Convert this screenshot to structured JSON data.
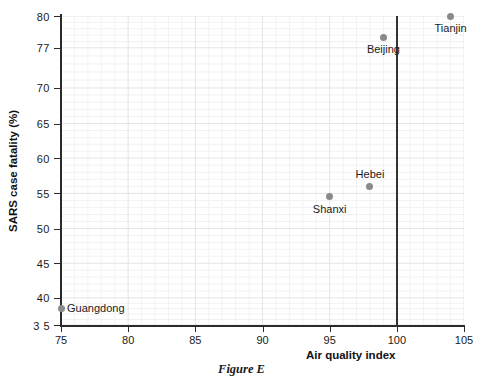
{
  "caption": "Figure E",
  "chart_data": {
    "type": "scatter",
    "title": "",
    "xlabel": "Air quality index",
    "ylabel": "SARS case fatality (%)",
    "xlim": [
      75,
      105
    ],
    "ylim": [
      35,
      80
    ],
    "grid": true,
    "legend": "none",
    "x_ticks": [
      75,
      80,
      85,
      90,
      95,
      100,
      105
    ],
    "x_tick_labels": [
      "75",
      "80",
      "85",
      "90",
      "95",
      "100",
      "105"
    ],
    "y_ticks": [
      35,
      40,
      45,
      50,
      55,
      60,
      65,
      70,
      77,
      80
    ],
    "y_tick_labels": [
      "3 5",
      "40",
      "45",
      "50",
      "55",
      "60",
      "65",
      "70",
      "77",
      "80"
    ],
    "annotations": [
      {
        "label": "Guangdong",
        "x": 75,
        "y": 38,
        "label_position": "right"
      },
      {
        "label": "Shanxi",
        "x": 95,
        "y": 54.5,
        "label_position": "below"
      },
      {
        "label": "Hebei",
        "x": 98,
        "y": 56,
        "label_position": "above"
      },
      {
        "label": "Beijing",
        "x": 99,
        "y": 78,
        "label_position": "below"
      },
      {
        "label": "Tianjin",
        "x": 104,
        "y": 80,
        "label_position": "below"
      }
    ],
    "reference_line": {
      "orientation": "vertical",
      "x": 100,
      "color": "#333333"
    },
    "points": [
      {
        "name": "Guangdong",
        "x": 75,
        "y": 38
      },
      {
        "name": "Shanxi",
        "x": 95,
        "y": 54.5
      },
      {
        "name": "Hebei",
        "x": 98,
        "y": 56
      },
      {
        "name": "Beijing",
        "x": 99,
        "y": 78
      },
      {
        "name": "Tianjin",
        "x": 104,
        "y": 80
      }
    ],
    "marker_color": "#8a8a8a",
    "grid_color": "#ebebeb"
  }
}
